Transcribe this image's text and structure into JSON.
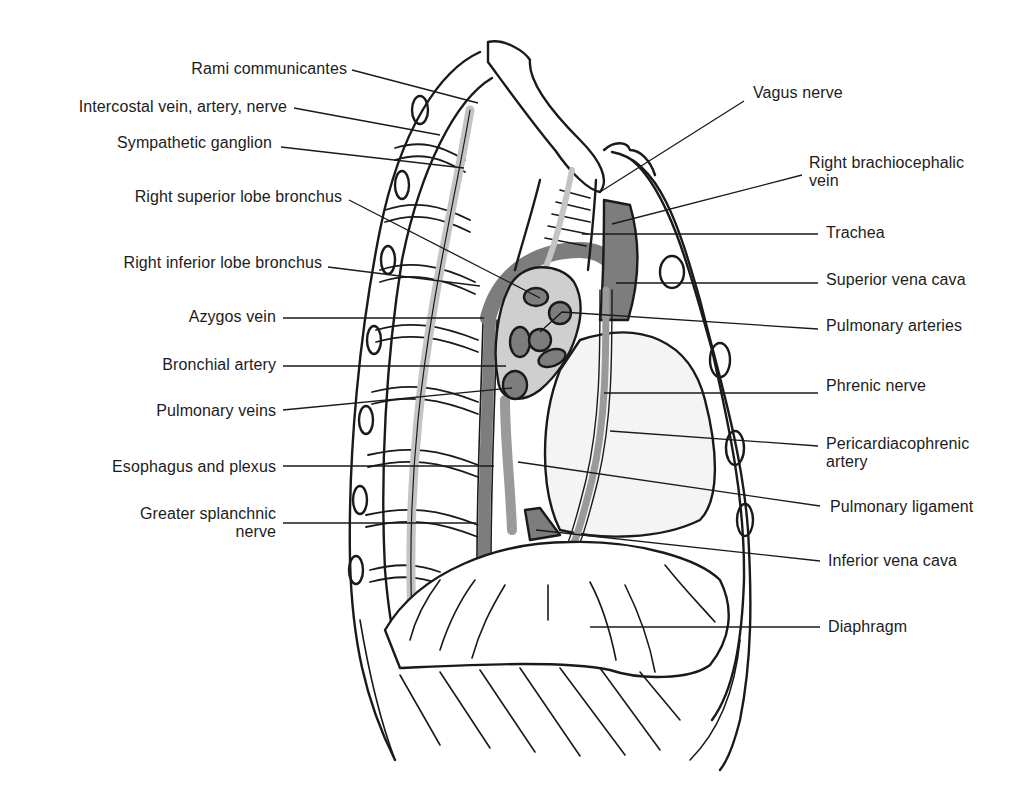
{
  "figure": {
    "colors": {
      "outline": "#1a1a1a",
      "vessel_dark": "#7d7d7d",
      "vessel_mid": "#9a9a9a",
      "nerve_light": "#c4c4c4",
      "background": "#ffffff"
    }
  },
  "labels_left": [
    {
      "id": "rami-communicantes",
      "text": "Rami communicantes",
      "line2": "",
      "x": 347,
      "y": 60,
      "lead": [
        352,
        70,
        478,
        103
      ]
    },
    {
      "id": "intercostal-vein-artery-nerve",
      "text": "Intercostal vein, artery, nerve",
      "line2": "",
      "x": 287,
      "y": 98,
      "lead": [
        294,
        108,
        440,
        135
      ]
    },
    {
      "id": "sympathetic-ganglion",
      "text": "Sympathetic ganglion",
      "line2": "",
      "x": 272,
      "y": 134,
      "lead": [
        281,
        147,
        464,
        168
      ]
    },
    {
      "id": "right-superior-lobe-bronchus",
      "text": "Right superior lobe bronchus",
      "line2": "",
      "x": 342,
      "y": 188,
      "lead": [
        349,
        200,
        540,
        298
      ]
    },
    {
      "id": "right-inferior-lobe-bronchus",
      "text": "Right inferior lobe bronchus",
      "line2": "",
      "x": 322,
      "y": 254,
      "lead": [
        328,
        267,
        480,
        286
      ]
    },
    {
      "id": "azygos-vein",
      "text": "Azygos vein",
      "line2": "",
      "x": 276,
      "y": 308,
      "lead": [
        283,
        318,
        484,
        318
      ]
    },
    {
      "id": "bronchial-artery",
      "text": "Bronchial artery",
      "line2": "",
      "x": 276,
      "y": 356,
      "lead": [
        283,
        366,
        506,
        366
      ]
    },
    {
      "id": "pulmonary-veins",
      "text": "Pulmonary veins",
      "line2": "",
      "x": 276,
      "y": 402,
      "lead": [
        283,
        410,
        512,
        388
      ]
    },
    {
      "id": "esophagus-and-plexus",
      "text": "Esophagus and plexus",
      "line2": "",
      "x": 276,
      "y": 458,
      "lead": [
        283,
        466,
        494,
        466
      ]
    },
    {
      "id": "greater-splanchnic-nerve",
      "text": "Greater splanchnic",
      "line2": "nerve",
      "x": 276,
      "y": 505,
      "lead": [
        283,
        523,
        476,
        523
      ]
    }
  ],
  "labels_right": [
    {
      "id": "vagus-nerve",
      "text": "Vagus nerve",
      "line2": "",
      "x": 753,
      "y": 84,
      "lead": [
        744,
        101,
        600,
        192
      ]
    },
    {
      "id": "right-brachiocephalic-vein",
      "text": "Right brachiocephalic",
      "line2": "vein",
      "x": 809,
      "y": 154,
      "lead": [
        802,
        175,
        612,
        224
      ]
    },
    {
      "id": "trachea",
      "text": "Trachea",
      "line2": "",
      "x": 826,
      "y": 224,
      "lead": [
        818,
        234,
        582,
        234
      ]
    },
    {
      "id": "superior-vena-cava",
      "text": "Superior vena cava",
      "line2": "",
      "x": 826,
      "y": 271,
      "lead": [
        818,
        283,
        616,
        283
      ]
    },
    {
      "id": "pulmonary-arteries",
      "text": "Pulmonary arteries",
      "line2": "",
      "x": 826,
      "y": 317,
      "lead": [
        818,
        329,
        562,
        312,
        540,
        332
      ]
    },
    {
      "id": "phrenic-nerve",
      "text": "Phrenic nerve",
      "line2": "",
      "x": 826,
      "y": 377,
      "lead": [
        818,
        393,
        604,
        393
      ]
    },
    {
      "id": "pericardiacophrenic-artery",
      "text": "Pericardiacophrenic",
      "line2": "artery",
      "x": 826,
      "y": 435,
      "lead": [
        818,
        446,
        610,
        431
      ]
    },
    {
      "id": "pulmonary-ligament",
      "text": "Pulmonary ligament",
      "line2": "",
      "x": 830,
      "y": 498,
      "lead": [
        820,
        506,
        518,
        462
      ]
    },
    {
      "id": "inferior-vena-cava",
      "text": "Inferior vena cava",
      "line2": "",
      "x": 828,
      "y": 552,
      "lead": [
        820,
        561,
        536,
        530
      ]
    },
    {
      "id": "diaphragm",
      "text": "Diaphragm",
      "line2": "",
      "x": 828,
      "y": 618,
      "lead": [
        820,
        627,
        590,
        627
      ]
    }
  ]
}
